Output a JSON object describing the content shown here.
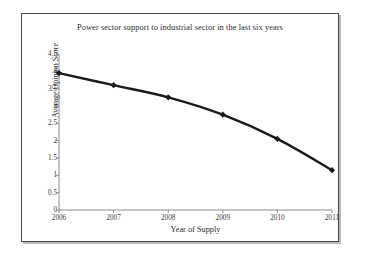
{
  "chart_data": {
    "type": "line",
    "title": "Power sector support to industrial sector in the last six years",
    "xlabel": "Year of Supply",
    "ylabel": "Average Opinion Score",
    "categories": [
      "2006",
      "2007",
      "2008",
      "2009",
      "2010",
      "2011"
    ],
    "values": [
      3.95,
      3.6,
      3.25,
      2.75,
      2.05,
      1.15
    ],
    "series": [
      {
        "name": "Average Opinion Score",
        "values": [
          3.95,
          3.6,
          3.25,
          2.75,
          2.05,
          1.15
        ]
      }
    ],
    "ylim": [
      0,
      4.5
    ],
    "ytick_labels": [
      "4.5",
      "4",
      "3.5",
      "3",
      "2.5",
      "2",
      "1.5",
      "1",
      "0.5",
      "0"
    ],
    "ytick_values": [
      4.5,
      4,
      3.5,
      3,
      2.5,
      2,
      1.5,
      1,
      0.5,
      0
    ],
    "xtick_labels": [
      "2006",
      "2007",
      "2008",
      "2009",
      "2010",
      "2011"
    ],
    "grid": false,
    "legend": "none",
    "marker": "diamond",
    "line_color": "#1a1a1a",
    "marker_color": "#1a1a1a",
    "axis_color": "#808080",
    "plot_background": "#ffffff",
    "frame_color": "#4a4a4a"
  }
}
